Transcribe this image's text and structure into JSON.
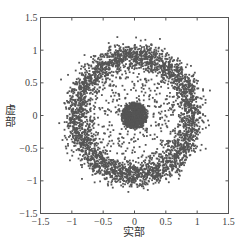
{
  "chart_data": {
    "type": "scatter",
    "title": "",
    "xlabel": "实部",
    "ylabel": "虚部",
    "xlim": [
      -1.5,
      1.5
    ],
    "ylim": [
      -1.5,
      1.5
    ],
    "xticks": [
      -1.5,
      -1,
      -0.5,
      0,
      0.5,
      1,
      1.5
    ],
    "yticks": [
      -1.5,
      -1,
      -0.5,
      0,
      0.5,
      1,
      1.5
    ],
    "xtick_labels": [
      "−1.5",
      "−1",
      "−0.5",
      "0",
      "0.5",
      "1",
      "1.5"
    ],
    "ytick_labels": [
      "−1.5",
      "−1",
      "−0.5",
      "0",
      "0.5",
      "1",
      "1.5"
    ],
    "grid": false,
    "legend": null,
    "marker_color": "#555555",
    "axis_color": "#555555",
    "series": [
      {
        "name": "outer-ring",
        "shape": "ring",
        "center": [
          0,
          0
        ],
        "radius": 0.92,
        "radial_spread": 0.1,
        "count": 3200
      },
      {
        "name": "center-cluster",
        "shape": "disk",
        "center": [
          0,
          0
        ],
        "radius": 0.2,
        "count": 900
      },
      {
        "name": "inner-scatter",
        "shape": "uniform-annulus",
        "center": [
          0,
          0
        ],
        "inner_radius": 0.15,
        "outer_radius": 0.85,
        "count": 420
      }
    ]
  },
  "labels": {
    "xlabel": "实部",
    "ylabel": "虚部"
  }
}
